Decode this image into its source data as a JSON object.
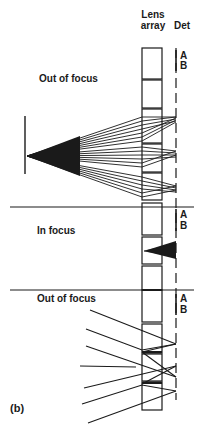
{
  "header": {
    "lens_line1": "Lens",
    "lens_line2": "array",
    "det": "Det"
  },
  "sections": [
    {
      "title": "Out of focus",
      "det_a": "A",
      "det_b": "B"
    },
    {
      "title": "In focus",
      "det_a": "A",
      "det_b": "B"
    },
    {
      "title": "Out of focus",
      "det_a": "A",
      "det_b": "B"
    }
  ],
  "panel_label": "(b)",
  "colors": {
    "ink": "#1a1a1a",
    "background": "#ffffff"
  }
}
